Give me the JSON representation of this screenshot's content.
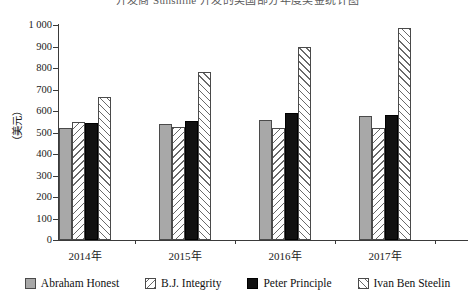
{
  "chart_data": {
    "type": "bar",
    "title": "开发商 Sunshine 开发的美国部分年度奖金统计图",
    "xlabel": "",
    "ylabel": "（美元）",
    "ylim": [
      0,
      1000
    ],
    "ytick_step": 100,
    "ytick_labels": [
      "0",
      "100",
      "200",
      "300",
      "400",
      "500",
      "600",
      "700",
      "800",
      "900",
      "1 000"
    ],
    "categories": [
      "2014年",
      "2015年",
      "2016年",
      "2017年"
    ],
    "grid": false,
    "legend_position": "bottom",
    "series": [
      {
        "name": "Abraham Honest",
        "fill": "solid-gray",
        "color": "#a8a8a8",
        "values": [
          520,
          540,
          560,
          575
        ]
      },
      {
        "name": "B.J. Integrity",
        "fill": "backslash-hatch",
        "color": "#ffffff",
        "values": [
          550,
          525,
          520,
          520
        ]
      },
      {
        "name": "Peter Principle",
        "fill": "solid-black",
        "color": "#111111",
        "values": [
          545,
          555,
          590,
          580
        ]
      },
      {
        "name": "Ivan Ben Steelin",
        "fill": "forward-hatch",
        "color": "#ffffff",
        "values": [
          665,
          780,
          900,
          985
        ]
      }
    ]
  }
}
